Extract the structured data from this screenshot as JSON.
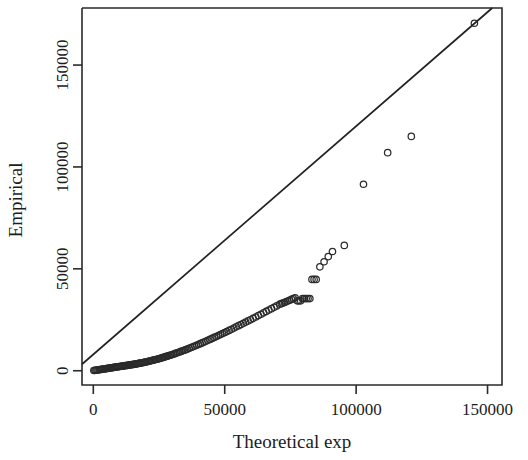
{
  "chart_data": {
    "type": "scatter",
    "title": "",
    "subtitle": "",
    "xlabel": "Theoretical exp",
    "ylabel": "Empirical",
    "xlim": [
      -4300,
      155500
    ],
    "ylim": [
      -7000,
      178000
    ],
    "xticks": [
      0,
      50000,
      100000,
      150000
    ],
    "xtick_labels": [
      "0",
      "50000",
      "100000",
      "150000"
    ],
    "yticks": [
      0,
      50000,
      100000,
      150000
    ],
    "ytick_labels": [
      "0",
      "50000",
      "100000",
      "150000"
    ],
    "grid": false,
    "legend": null,
    "marker": "open-circle",
    "marker_color": "#2b2b2b",
    "point_radius_px": 3.2,
    "annotations": [
      {
        "kind": "reference-line",
        "description": "straight diagonal reference line",
        "x0": 0,
        "y0": 8000,
        "x1": 150000,
        "y1": 176000,
        "color": "#222222"
      }
    ],
    "series": [
      {
        "name": "Q-Q points",
        "x": [
          200,
          600,
          1000,
          1400,
          1800,
          2200,
          2600,
          3000,
          3400,
          3800,
          4200,
          4600,
          5000,
          5400,
          5800,
          6200,
          6600,
          7000,
          7400,
          7800,
          8200,
          8600,
          9000,
          9400,
          9800,
          10200,
          10600,
          11000,
          11400,
          11800,
          12200,
          12600,
          13000,
          13400,
          13800,
          14200,
          14600,
          15000,
          15400,
          15800,
          16200,
          16600,
          17000,
          17400,
          17800,
          18200,
          18600,
          19000,
          19400,
          19800,
          20300,
          20800,
          21300,
          21800,
          22300,
          22800,
          23300,
          23800,
          24300,
          24800,
          25300,
          25800,
          26300,
          26800,
          27300,
          27800,
          28300,
          28800,
          29300,
          29800,
          30400,
          31000,
          31600,
          32200,
          32800,
          33400,
          34000,
          34600,
          35200,
          35800,
          36500,
          37200,
          37900,
          38600,
          39300,
          40000,
          40700,
          41400,
          42100,
          42800,
          43600,
          44400,
          45200,
          46000,
          46800,
          47600,
          48400,
          49200,
          50000,
          50800,
          51700,
          52600,
          53500,
          54400,
          55300,
          56200,
          57100,
          58000,
          58900,
          59800,
          60800,
          61800,
          62800,
          63800,
          64800,
          65800,
          66800,
          67800,
          68800,
          69800,
          70900,
          71500,
          72100,
          72700,
          73300,
          74000,
          74700,
          75400,
          76100,
          76800,
          77600,
          78200,
          78900,
          79600,
          80300,
          81000,
          81700,
          82400,
          83200,
          84000,
          84800,
          86200,
          87800,
          89400,
          91000,
          95500,
          102800,
          112000,
          121000,
          145000
        ],
        "y": [
          100,
          180,
          260,
          340,
          420,
          500,
          580,
          660,
          740,
          820,
          900,
          980,
          1060,
          1140,
          1220,
          1300,
          1380,
          1460,
          1540,
          1620,
          1700,
          1780,
          1860,
          1940,
          2020,
          2100,
          2180,
          2260,
          2340,
          2420,
          2500,
          2580,
          2660,
          2740,
          2820,
          2900,
          2980,
          3060,
          3140,
          3220,
          3320,
          3420,
          3520,
          3620,
          3720,
          3820,
          3920,
          4020,
          4120,
          4220,
          4380,
          4540,
          4700,
          4860,
          5020,
          5180,
          5340,
          5500,
          5660,
          5820,
          6020,
          6220,
          6420,
          6620,
          6820,
          7020,
          7220,
          7420,
          7620,
          7820,
          8100,
          8380,
          8660,
          8940,
          9220,
          9500,
          9780,
          10060,
          10340,
          10620,
          11000,
          11380,
          11760,
          12140,
          12520,
          12900,
          13280,
          13660,
          14040,
          14420,
          14900,
          15380,
          15860,
          16340,
          16820,
          17300,
          17780,
          18260,
          18740,
          19220,
          19800,
          20380,
          20960,
          21540,
          22120,
          22700,
          23280,
          23860,
          24440,
          25020,
          25700,
          26380,
          27060,
          27740,
          28420,
          29100,
          29780,
          30460,
          31140,
          31820,
          32600,
          32900,
          33200,
          33500,
          33800,
          34200,
          34600,
          35000,
          35400,
          35800,
          34300,
          34300,
          34300,
          35400,
          35400,
          35400,
          35400,
          35400,
          44800,
          44800,
          44800,
          51000,
          53500,
          56000,
          58500,
          61500,
          91500,
          107000,
          115000,
          170500
        ]
      }
    ]
  },
  "axes": {
    "x_axis_name": "x-axis",
    "y_axis_name": "y-axis"
  }
}
